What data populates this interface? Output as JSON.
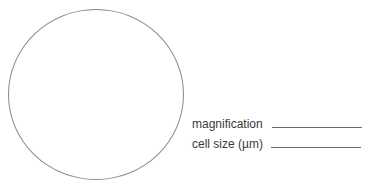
{
  "drawing_area": {
    "shape": "circle",
    "description": "field of view"
  },
  "fields": [
    {
      "label": "magnification",
      "value": ""
    },
    {
      "label": "cell size (µm)",
      "value": ""
    }
  ],
  "colors": {
    "outline": "#8a8a8a",
    "text": "#3a3a3a",
    "background": "#ffffff"
  }
}
